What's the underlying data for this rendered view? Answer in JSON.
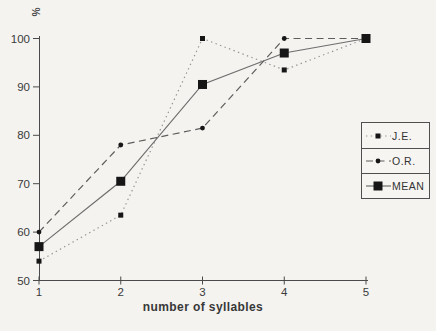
{
  "figure": {
    "background": "#f4f3f0",
    "axis_color": "#4a4a4a",
    "text_color": "#3a3a3a",
    "marker_color": "#161616"
  },
  "chart_data": {
    "type": "line",
    "title": "",
    "xlabel": "number of syllables",
    "ylabel": "%",
    "x": [
      1,
      2,
      3,
      4,
      5
    ],
    "xticks": [
      "1",
      "2",
      "3",
      "4",
      "5"
    ],
    "yticks": [
      50,
      60,
      70,
      80,
      90,
      100
    ],
    "xlim": [
      1,
      5
    ],
    "ylim": [
      50,
      100
    ],
    "grid": false,
    "legend_position": "right-middle",
    "series": [
      {
        "name": "J.E.",
        "line_style": "dotted",
        "marker": "small-square",
        "line_color": "#949494",
        "values": [
          54,
          63.5,
          100,
          93.5,
          100
        ]
      },
      {
        "name": "O.R.",
        "line_style": "dashed",
        "marker": "small-circle",
        "line_color": "#5d5d5d",
        "values": [
          60,
          78,
          81.5,
          100,
          100
        ]
      },
      {
        "name": "MEAN",
        "line_style": "solid",
        "marker": "large-square",
        "line_color": "#6e6e6e",
        "values": [
          57,
          70.5,
          90.5,
          97,
          100
        ]
      }
    ]
  }
}
